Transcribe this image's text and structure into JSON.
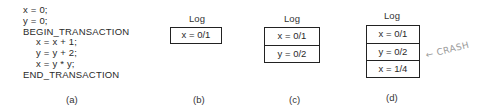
{
  "panel_a": {
    "code_lines": [
      {
        "text": "x = 0;",
        "indent": false
      },
      {
        "text": "y = 0;",
        "indent": false
      },
      {
        "text": "BEGIN_TRANSACTION",
        "indent": false
      },
      {
        "text": "x = x + 1;",
        "indent": true
      },
      {
        "text": "y = y + 2;",
        "indent": true
      },
      {
        "text": "x = y * y;",
        "indent": true
      },
      {
        "text": "END_TRANSACTION",
        "indent": false
      }
    ],
    "caption": "(a)"
  },
  "panel_b": {
    "title": "Log",
    "entries": [
      "x = 0/1"
    ],
    "caption": "(b)"
  },
  "panel_c": {
    "title": "Log",
    "entries": [
      "x = 0/1",
      "y = 0/2"
    ],
    "caption": "(c)"
  },
  "panel_d": {
    "title": "Log",
    "entries": [
      "x = 0/1",
      "y = 0/2",
      "x = 1/4"
    ],
    "caption": "(d)",
    "annotation": "← CRASH"
  }
}
